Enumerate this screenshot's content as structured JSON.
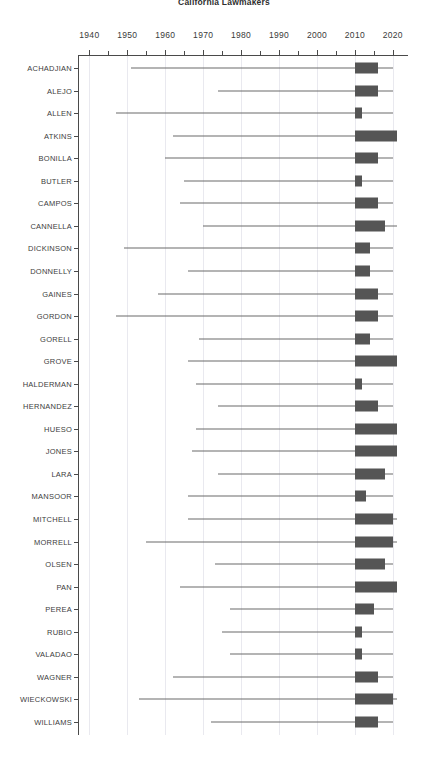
{
  "chart": {
    "title": "California Lawmakers",
    "xlabel": "",
    "ylabel": ""
  },
  "chart_data": {
    "type": "bar",
    "title": "California Lawmakers",
    "xlabel": "",
    "ylabel": "",
    "xlim": [
      1937,
      2024
    ],
    "xticks": [
      1940,
      1945,
      1950,
      1955,
      1960,
      1965,
      1970,
      1975,
      1980,
      1985,
      1990,
      1995,
      2000,
      2005,
      2010,
      2015,
      2020
    ],
    "xtick_labels": [
      "1940",
      "",
      "1950",
      "",
      "1960",
      "",
      "1970",
      "",
      "1980",
      "",
      "1990",
      "",
      "2000",
      "",
      "2010",
      "",
      "2020"
    ],
    "grid": true,
    "legend": "none",
    "categories": [
      "ACHADJIAN",
      "ALEJO",
      "ALLEN",
      "ATKINS",
      "BONILLA",
      "BUTLER",
      "CAMPOS",
      "CANNELLA",
      "DICKINSON",
      "DONNELLY",
      "GAINES",
      "GORDON",
      "GORELL",
      "GROVE",
      "HALDERMAN",
      "HERNANDEZ",
      "HUESO",
      "JONES",
      "LARA",
      "MANSOOR",
      "MITCHELL",
      "MORRELL",
      "OLSEN",
      "PAN",
      "PEREA",
      "RUBIO",
      "VALADAO",
      "WAGNER",
      "WIECKOWSKI",
      "WILLIAMS"
    ],
    "series": [
      {
        "name": "ACHADJIAN",
        "whisker_start": 1951,
        "whisker_end": 2020,
        "box_start": 2010,
        "box_end": 2016
      },
      {
        "name": "ALEJO",
        "whisker_start": 1974,
        "whisker_end": 2020,
        "box_start": 2010,
        "box_end": 2016
      },
      {
        "name": "ALLEN",
        "whisker_start": 1947,
        "whisker_end": 2020,
        "box_start": 2010,
        "box_end": 2012
      },
      {
        "name": "ATKINS",
        "whisker_start": 1962,
        "whisker_end": 2021,
        "box_start": 2010,
        "box_end": 2021
      },
      {
        "name": "BONILLA",
        "whisker_start": 1960,
        "whisker_end": 2020,
        "box_start": 2010,
        "box_end": 2016
      },
      {
        "name": "BUTLER",
        "whisker_start": 1965,
        "whisker_end": 2020,
        "box_start": 2010,
        "box_end": 2012
      },
      {
        "name": "CAMPOS",
        "whisker_start": 1964,
        "whisker_end": 2020,
        "box_start": 2010,
        "box_end": 2016
      },
      {
        "name": "CANNELLA",
        "whisker_start": 1970,
        "whisker_end": 2021,
        "box_start": 2010,
        "box_end": 2018
      },
      {
        "name": "DICKINSON",
        "whisker_start": 1949,
        "whisker_end": 2020,
        "box_start": 2010,
        "box_end": 2014
      },
      {
        "name": "DONNELLY",
        "whisker_start": 1966,
        "whisker_end": 2020,
        "box_start": 2010,
        "box_end": 2014
      },
      {
        "name": "GAINES",
        "whisker_start": 1958,
        "whisker_end": 2020,
        "box_start": 2010,
        "box_end": 2016
      },
      {
        "name": "GORDON",
        "whisker_start": 1947,
        "whisker_end": 2020,
        "box_start": 2010,
        "box_end": 2016
      },
      {
        "name": "GORELL",
        "whisker_start": 1969,
        "whisker_end": 2020,
        "box_start": 2010,
        "box_end": 2014
      },
      {
        "name": "GROVE",
        "whisker_start": 1966,
        "whisker_end": 2021,
        "box_start": 2010,
        "box_end": 2021
      },
      {
        "name": "HALDERMAN",
        "whisker_start": 1968,
        "whisker_end": 2020,
        "box_start": 2010,
        "box_end": 2012
      },
      {
        "name": "HERNANDEZ",
        "whisker_start": 1974,
        "whisker_end": 2020,
        "box_start": 2010,
        "box_end": 2016
      },
      {
        "name": "HUESO",
        "whisker_start": 1968,
        "whisker_end": 2021,
        "box_start": 2010,
        "box_end": 2021
      },
      {
        "name": "JONES",
        "whisker_start": 1967,
        "whisker_end": 2021,
        "box_start": 2010,
        "box_end": 2021
      },
      {
        "name": "LARA",
        "whisker_start": 1974,
        "whisker_end": 2020,
        "box_start": 2010,
        "box_end": 2018
      },
      {
        "name": "MANSOOR",
        "whisker_start": 1966,
        "whisker_end": 2020,
        "box_start": 2010,
        "box_end": 2013
      },
      {
        "name": "MITCHELL",
        "whisker_start": 1966,
        "whisker_end": 2021,
        "box_start": 2010,
        "box_end": 2020
      },
      {
        "name": "MORRELL",
        "whisker_start": 1955,
        "whisker_end": 2021,
        "box_start": 2010,
        "box_end": 2020
      },
      {
        "name": "OLSEN",
        "whisker_start": 1973,
        "whisker_end": 2020,
        "box_start": 2010,
        "box_end": 2018
      },
      {
        "name": "PAN",
        "whisker_start": 1964,
        "whisker_end": 2021,
        "box_start": 2010,
        "box_end": 2021
      },
      {
        "name": "PEREA",
        "whisker_start": 1977,
        "whisker_end": 2020,
        "box_start": 2010,
        "box_end": 2015
      },
      {
        "name": "RUBIO",
        "whisker_start": 1975,
        "whisker_end": 2020,
        "box_start": 2010,
        "box_end": 2012
      },
      {
        "name": "VALADAO",
        "whisker_start": 1977,
        "whisker_end": 2020,
        "box_start": 2010,
        "box_end": 2012
      },
      {
        "name": "WAGNER",
        "whisker_start": 1962,
        "whisker_end": 2020,
        "box_start": 2010,
        "box_end": 2016
      },
      {
        "name": "WIECKOWSKI",
        "whisker_start": 1953,
        "whisker_end": 2021,
        "box_start": 2010,
        "box_end": 2020
      },
      {
        "name": "WILLIAMS",
        "whisker_start": 1972,
        "whisker_end": 2020,
        "box_start": 2010,
        "box_end": 2016
      }
    ],
    "colors": {
      "box": "#555555",
      "whisker": "#6b6b6b",
      "grid": "#e9e9ef",
      "axis": "#4a4a4a",
      "text": "#3a3a3a"
    }
  }
}
